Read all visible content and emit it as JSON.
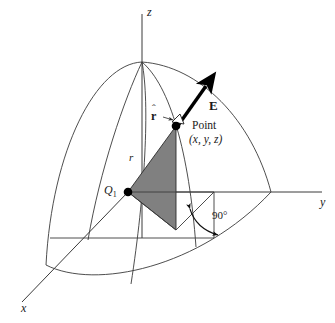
{
  "figure": {
    "background_color": "#ffffff",
    "line_color": "#3a3a3a",
    "shade_color": "#808080",
    "accent_color": "#000000"
  },
  "axes": {
    "z_label": "z",
    "y_label": "y",
    "x_label": "x"
  },
  "labels": {
    "charge": "Q",
    "charge_subscript": "1",
    "radius": "r",
    "field_vector": "E",
    "unit_vector": "r",
    "unit_vector_hat": "ˆ",
    "point_name": "Point",
    "point_coords": "(x, y, z)",
    "right_angle": "90°"
  },
  "geometry": {
    "origin": {
      "x": 128,
      "y": 192
    },
    "point": {
      "x": 176,
      "y": 126
    },
    "foot": {
      "x": 176,
      "y": 230
    },
    "z_top": {
      "x": 142,
      "y": 14
    },
    "z_pole": {
      "x": 142,
      "y": 62
    },
    "y_end": {
      "x": 320,
      "y": 192
    },
    "x_end": {
      "x": 22,
      "y": 302
    },
    "e_arrow_tip": {
      "x": 207,
      "y": 85
    },
    "sphere_radius_px": 110
  }
}
